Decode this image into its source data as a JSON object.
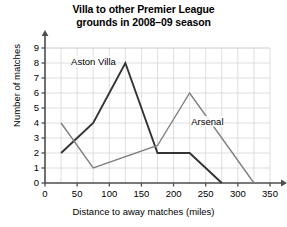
{
  "chart_data": {
    "type": "line",
    "title": "Villa to other Premier League grounds in 2008–09 season",
    "title_line1": "Villa to other Premier League",
    "title_line2": "grounds in 2008–09 season",
    "xlabel": "Distance to away matches (miles)",
    "ylabel": "Number of matches",
    "xlim": [
      0,
      350
    ],
    "ylim": [
      0,
      9
    ],
    "xticks": [
      0,
      50,
      100,
      150,
      200,
      250,
      300,
      350
    ],
    "yticks": [
      0,
      1,
      2,
      3,
      4,
      5,
      6,
      7,
      8,
      9
    ],
    "grid": true,
    "legend": "inline-labels",
    "series": [
      {
        "name": "Aston Villa",
        "color": "#333333",
        "label_x": 25,
        "label_y": 8,
        "x": [
          25,
          75,
          125,
          175,
          225,
          275
        ],
        "y": [
          2,
          4,
          8,
          2,
          2,
          0
        ],
        "points": [
          {
            "x": 25,
            "y": 2
          },
          {
            "x": 75,
            "y": 4
          },
          {
            "x": 125,
            "y": 8
          },
          {
            "x": 175,
            "y": 2
          },
          {
            "x": 225,
            "y": 2
          },
          {
            "x": 275,
            "y": 0
          }
        ]
      },
      {
        "name": "Arsenal",
        "color": "#808080",
        "label_x": 240,
        "label_y": 4,
        "x": [
          25,
          75,
          175,
          225,
          325
        ],
        "y": [
          4,
          1,
          2.5,
          6,
          0
        ],
        "points": [
          {
            "x": 25,
            "y": 4
          },
          {
            "x": 75,
            "y": 1
          },
          {
            "x": 175,
            "y": 2.5
          },
          {
            "x": 225,
            "y": 6
          },
          {
            "x": 325,
            "y": 0
          }
        ]
      }
    ]
  },
  "axis": {
    "y_ticks": [
      "0",
      "1",
      "2",
      "3",
      "4",
      "5",
      "6",
      "7",
      "8",
      "9"
    ],
    "x_ticks": [
      "0",
      "50",
      "100",
      "150",
      "200",
      "250",
      "300",
      "350"
    ]
  },
  "labels": {
    "series1": "Aston Villa",
    "series2": "Arsenal"
  },
  "colors": {
    "series1": "#333333",
    "series2": "#808080",
    "grid": "#d5d5dd",
    "axis": "#4d4d4d",
    "background": "#ffffff"
  }
}
